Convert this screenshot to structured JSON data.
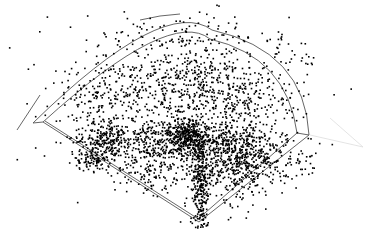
{
  "chart_data": {
    "type": "scatter",
    "title": "",
    "xlabel": "",
    "ylabel": "",
    "legend": [],
    "grid": false,
    "field": {
      "home_plate": [
        199,
        222
      ],
      "left_foul_corner_inner": [
        43,
        122
      ],
      "right_foul_corner_inner": [
        297,
        133
      ],
      "left_foul_corner_outer": [
        33,
        123
      ],
      "right_foul_corner_outer": [
        309,
        135
      ],
      "inner_arc_apex": [
        190,
        37
      ],
      "outer_arc_apex": [
        190,
        29
      ],
      "extra_arc_top": [
        [
          140,
          20
        ],
        [
          180,
          14
        ]
      ],
      "extra_line_left": [
        [
          17,
          130
        ],
        [
          40,
          95
        ]
      ],
      "faint_right_lines": [
        [
          [
            310,
            135
          ],
          [
            363,
            147
          ]
        ],
        [
          [
            330,
            118
          ],
          [
            363,
            147
          ]
        ]
      ],
      "line_color": "#555555",
      "faint_line_color": "#dddddd"
    },
    "point_color": "#000000",
    "point_radius": 0.8,
    "seed": 12345,
    "clusters": [
      {
        "name": "up-the-middle streak",
        "cx": 201,
        "cy": 190,
        "sx": 4,
        "sy": 28,
        "n": 260
      },
      {
        "name": "center infield dense",
        "cx": 188,
        "cy": 135,
        "sx": 10,
        "sy": 10,
        "n": 320
      },
      {
        "name": "second-base band",
        "cx": 215,
        "cy": 140,
        "sx": 32,
        "sy": 8,
        "n": 300
      },
      {
        "name": "shortstop band",
        "cx": 150,
        "cy": 140,
        "sx": 30,
        "sy": 10,
        "n": 260
      },
      {
        "name": "third base hole",
        "cx": 105,
        "cy": 142,
        "sx": 14,
        "sy": 10,
        "n": 200
      },
      {
        "name": "left foul line grounders",
        "cx": 92,
        "cy": 160,
        "sx": 10,
        "sy": 5,
        "n": 90
      },
      {
        "name": "first base band",
        "cx": 255,
        "cy": 158,
        "sx": 18,
        "sy": 14,
        "n": 200
      },
      {
        "name": "right side streak",
        "cx": 240,
        "cy": 175,
        "sx": 10,
        "sy": 18,
        "n": 130
      },
      {
        "name": "right foul area",
        "cx": 295,
        "cy": 165,
        "sx": 12,
        "sy": 8,
        "n": 40
      },
      {
        "name": "left-center outfield",
        "cx": 150,
        "cy": 85,
        "sx": 28,
        "sy": 20,
        "n": 220
      },
      {
        "name": "center outfield",
        "cx": 200,
        "cy": 75,
        "sx": 25,
        "sy": 20,
        "n": 200
      },
      {
        "name": "right-center outfield",
        "cx": 240,
        "cy": 100,
        "sx": 22,
        "sy": 20,
        "n": 200
      },
      {
        "name": "left outfield",
        "cx": 95,
        "cy": 100,
        "sx": 22,
        "sy": 18,
        "n": 120
      },
      {
        "name": "shallow center",
        "cx": 210,
        "cy": 165,
        "sx": 22,
        "sy": 12,
        "n": 200
      },
      {
        "name": "shallow left",
        "cx": 150,
        "cy": 170,
        "sx": 20,
        "sy": 10,
        "n": 130
      },
      {
        "name": "warning track",
        "cx": 190,
        "cy": 38,
        "sx": 60,
        "sy": 6,
        "n": 60
      },
      {
        "name": "beyond wall right",
        "cx": 285,
        "cy": 65,
        "sx": 18,
        "sy": 18,
        "n": 45
      },
      {
        "name": "beyond wall top",
        "cx": 190,
        "cy": 22,
        "sx": 50,
        "sy": 6,
        "n": 25
      },
      {
        "name": "sparse fair territory",
        "cx": 195,
        "cy": 110,
        "sx": 60,
        "sy": 40,
        "n": 280
      }
    ]
  }
}
